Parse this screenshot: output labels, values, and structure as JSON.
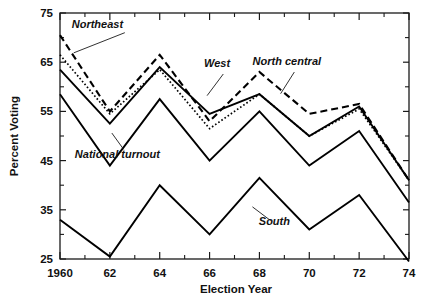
{
  "chart_data": {
    "type": "line",
    "title": "",
    "xlabel": "Election Year",
    "ylabel": "Percent Voting",
    "x": [
      1960,
      1962,
      1964,
      1966,
      1968,
      1970,
      1972,
      1974
    ],
    "xtick_labels": [
      "1960",
      "62",
      "64",
      "66",
      "68",
      "70",
      "72",
      "74"
    ],
    "ytick_labels": [
      "75",
      "65",
      "55",
      "45",
      "35",
      "25"
    ],
    "ytick_values": [
      75,
      65,
      55,
      45,
      35,
      25
    ],
    "xlim": [
      1960,
      1974
    ],
    "ylim": [
      25,
      75
    ],
    "grid": false,
    "legend_position": "inline-annotations",
    "minor_xticks": [
      1961,
      1963,
      1965,
      1967,
      1969,
      1971,
      1973
    ],
    "minor_yticks": [
      70,
      60,
      50,
      40,
      30
    ],
    "series": [
      {
        "name": "Northeast",
        "style": "dashed",
        "values": [
          70.5,
          55.0,
          66.5,
          53.0,
          63.0,
          54.5,
          56.5,
          41.0
        ],
        "label_x": 1961.5,
        "label_y": 72.0
      },
      {
        "name": "West",
        "style": "solid",
        "values": [
          63.5,
          52.5,
          64.0,
          54.5,
          58.5,
          50.0,
          56.0,
          41.0
        ],
        "label_x": 1966.3,
        "label_y": 64.0
      },
      {
        "name": "North central",
        "style": "dotted",
        "values": [
          66.5,
          54.5,
          63.5,
          51.5,
          58.5,
          50.0,
          55.5,
          41.0
        ],
        "label_x": 1969.1,
        "label_y": 64.5
      },
      {
        "name": "National turnout",
        "style": "solid",
        "values": [
          58.5,
          44.0,
          57.5,
          45.0,
          55.0,
          44.0,
          51.0,
          36.5
        ],
        "label_x": 1962.3,
        "label_y": 45.5
      },
      {
        "name": "South",
        "style": "solid",
        "values": [
          33.0,
          25.5,
          40.0,
          30.0,
          41.5,
          31.0,
          38.0,
          24.5
        ],
        "label_x": 1968.6,
        "label_y": 32.0
      }
    ],
    "annotations": [
      {
        "text": "Northeast",
        "leader_from": [
          1962.6,
          71.0
        ],
        "leader_to": [
          1960.55,
          66.9
        ]
      },
      {
        "text": "West",
        "leader_from": [
          1966.55,
          62.6
        ],
        "leader_to": [
          1965.9,
          58.2
        ]
      },
      {
        "text": "North central",
        "leader_from": [
          1969.4,
          63.0
        ],
        "leader_to": [
          1968.85,
          58.6
        ]
      },
      {
        "text": "National turnout",
        "leader_from": [
          1962.55,
          47.3
        ],
        "leader_to": [
          1962.08,
          50.6
        ]
      },
      {
        "text": "South",
        "leader_from": [
          1968.45,
          32.8
        ],
        "leader_to": [
          1967.72,
          35.6
        ]
      }
    ]
  }
}
